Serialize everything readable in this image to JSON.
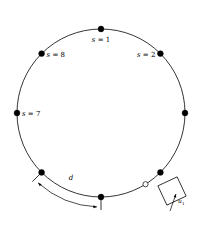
{
  "figure": {
    "background_color": "#ffffff",
    "stroke_color": "#000000",
    "node_fill_color": "#000000",
    "open_node_fill_color": "#ffffff"
  },
  "circle": {
    "center_x": 101,
    "center_y": 113,
    "radius": 84,
    "stroke_width": 0.8
  },
  "nodes": [
    {
      "index": 1,
      "name": "node-s1",
      "angle_deg": 90,
      "style": "filled",
      "label": "s = 1",
      "label_var": "s",
      "label_rest": " = 1",
      "label_dx": 0,
      "label_dy": 13,
      "label_anchor": "middle"
    },
    {
      "index": 2,
      "name": "node-s2",
      "angle_deg": 45,
      "style": "filled",
      "label": "s = 2",
      "label_var": "s",
      "label_rest": " = 2",
      "label_dx": -5,
      "label_dy": 3,
      "label_anchor": "end"
    },
    {
      "index": 3,
      "name": "node-s3",
      "angle_deg": 0,
      "style": "filled",
      "label": "",
      "label_var": "",
      "label_rest": "",
      "label_dx": 0,
      "label_dy": 0,
      "label_anchor": "start"
    },
    {
      "index": 4,
      "name": "node-s4",
      "angle_deg": -45,
      "style": "filled",
      "label": "",
      "label_var": "",
      "label_rest": "",
      "label_dx": 0,
      "label_dy": 0,
      "label_anchor": "start"
    },
    {
      "index": 5,
      "name": "node-s5",
      "angle_deg": -90,
      "style": "filled",
      "label": "",
      "label_var": "",
      "label_rest": "",
      "label_dx": 0,
      "label_dy": 0,
      "label_anchor": "middle"
    },
    {
      "index": 6,
      "name": "node-s6",
      "angle_deg": -135,
      "style": "filled",
      "label": "",
      "label_var": "",
      "label_rest": "",
      "label_dx": 0,
      "label_dy": 0,
      "label_anchor": "end"
    },
    {
      "index": 7,
      "name": "node-s7",
      "angle_deg": 180,
      "style": "filled",
      "label": "s = 7",
      "label_var": "s",
      "label_rest": " = 7",
      "label_dx": 5,
      "label_dy": 2.5,
      "label_anchor": "start"
    },
    {
      "index": 8,
      "name": "node-s8",
      "angle_deg": 135,
      "style": "filled",
      "label": "s = 8",
      "label_var": "s",
      "label_rest": " = 8",
      "label_dx": 5,
      "label_dy": 3,
      "label_anchor": "start"
    }
  ],
  "open_node": {
    "name": "open-node",
    "angle_deg": -58,
    "radius_px": 2.6,
    "fill": "#ffffff",
    "stroke": "#000000"
  },
  "distance_annotation": {
    "name": "arc-distance-d",
    "label": "d",
    "label_x": 71,
    "label_y": 180,
    "from_angle_deg": -135,
    "to_angle_deg": -90,
    "tick_length": 13
  },
  "square_marker": {
    "name": "square-marker",
    "label": "u",
    "label_subscript": "1",
    "center_x": 172,
    "center_y": 191,
    "half_diagonal": 15,
    "rotation_deg": 20,
    "label_x": 178,
    "label_y": 203
  }
}
